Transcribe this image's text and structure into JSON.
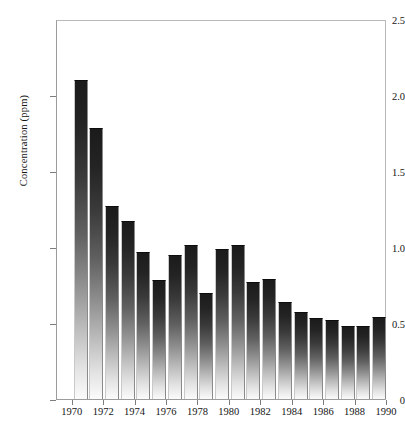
{
  "chart_data": {
    "type": "bar",
    "title": "",
    "subtitle": "",
    "xlabel": "",
    "ylabel": "Concentration (ppm)",
    "categories": [
      1970,
      1971,
      1972,
      1973,
      1974,
      1975,
      1976,
      1977,
      1978,
      1979,
      1980,
      1981,
      1982,
      1983,
      1984,
      1985,
      1986,
      1987,
      1988,
      1989
    ],
    "values": [
      2.1,
      1.78,
      1.27,
      1.17,
      0.97,
      0.78,
      0.95,
      1.01,
      0.7,
      0.99,
      1.01,
      0.77,
      0.79,
      0.64,
      0.57,
      0.53,
      0.52,
      0.48,
      0.48,
      0.54
    ],
    "series": [
      {
        "name": "Concentration",
        "values": [
          2.1,
          1.78,
          1.27,
          1.17,
          0.97,
          0.78,
          0.95,
          1.01,
          0.7,
          0.99,
          1.01,
          0.77,
          0.79,
          0.64,
          0.57,
          0.53,
          0.52,
          0.48,
          0.48,
          0.54
        ]
      }
    ],
    "ylim": [
      0,
      2.5
    ],
    "xlim": [
      1969,
      1990
    ],
    "ytick_labels": [
      "0",
      "0.5",
      "1.0",
      "1.5",
      "2.0",
      "2.5"
    ],
    "ytick_values": [
      0,
      0.5,
      1.0,
      1.5,
      2.0,
      2.5
    ],
    "xtick_labels": [
      "1970",
      "1972",
      "1974",
      "1976",
      "1978",
      "1980",
      "1982",
      "1984",
      "1986",
      "1988",
      "1990"
    ],
    "xtick_values": [
      1970,
      1972,
      1974,
      1976,
      1978,
      1980,
      1982,
      1984,
      1986,
      1988,
      1990
    ],
    "grid": false,
    "legend": false,
    "legend_position": "none",
    "bar_style": "vertical-gradient-dark-top",
    "annotations": []
  }
}
